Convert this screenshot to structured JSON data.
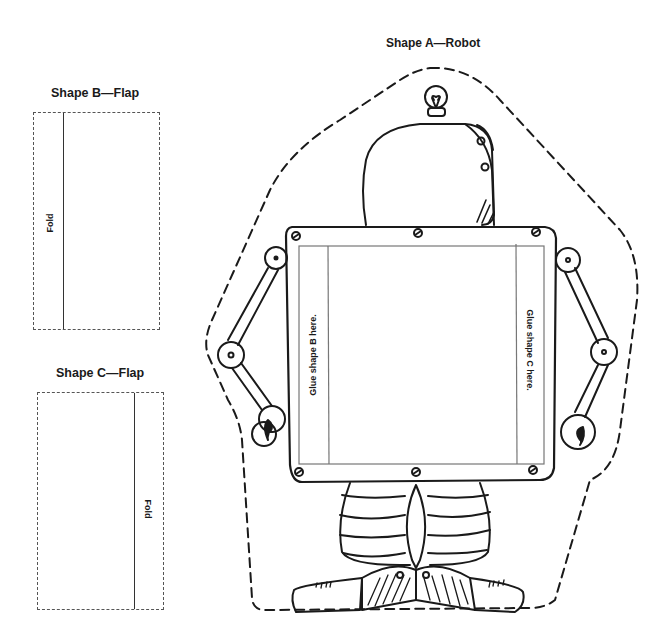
{
  "shapes": {
    "a": {
      "title": "Shape A—Robot",
      "glue_b": "Glue shape B here.",
      "glue_c": "Glue shape C here."
    },
    "b": {
      "title": "Shape B—Flap",
      "fold_label": "Fold"
    },
    "c": {
      "title": "Shape C—Flap",
      "fold_label": "Fold"
    }
  },
  "colors": {
    "ink": "#1a1a1a",
    "dashed": "#222222",
    "panel_line": "#777777"
  }
}
